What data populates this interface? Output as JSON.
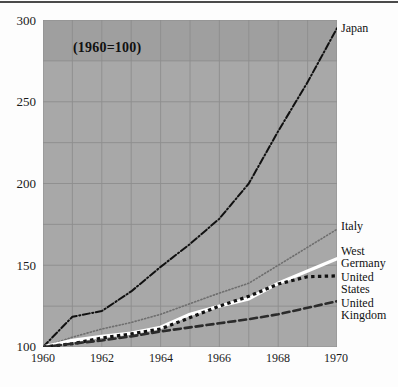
{
  "figure": {
    "annotation": "(1960=100)",
    "background_color": "#a8a8a8",
    "rule_color": "#4a4a4a"
  },
  "axis": {
    "y_ticks": [
      "100",
      "150",
      "200",
      "250",
      "300"
    ],
    "x_ticks": [
      "1960",
      "1962",
      "1964",
      "1966",
      "1968",
      "1970"
    ]
  },
  "series_labels": {
    "japan": "Japan",
    "italy": "Italy",
    "west_germany": "West\nGermany",
    "united_states": "United\nStates",
    "united_kingdom": "United\nKingdom"
  },
  "chart_data": {
    "type": "line",
    "title": "",
    "subtitle": "",
    "annotation": "(1960=100)",
    "xlabel": "",
    "ylabel": "",
    "xlim": [
      1960,
      1970
    ],
    "ylim": [
      100,
      300
    ],
    "grid": true,
    "x_tick_values": [
      1960,
      1962,
      1964,
      1966,
      1968,
      1970
    ],
    "y_tick_values": [
      100,
      150,
      200,
      250,
      300
    ],
    "y_gridline_values": [
      100,
      125,
      150,
      175,
      200,
      225,
      250,
      275,
      300
    ],
    "x_gridline_values": [
      1960,
      1961,
      1962,
      1963,
      1964,
      1965,
      1966,
      1967,
      1968,
      1969,
      1970
    ],
    "legend_position": "right-inline-labels",
    "x": [
      1960,
      1961,
      1962,
      1963,
      1964,
      1965,
      1966,
      1967,
      1968,
      1969,
      1970
    ],
    "series": [
      {
        "name": "Japan",
        "color": "#111111",
        "line_style": "dash-dot",
        "line_width": 2.0,
        "values": [
          100,
          118.5,
          122,
          134,
          149,
          163,
          178.5,
          200,
          232,
          262,
          295
        ]
      },
      {
        "name": "Italy",
        "color": "#6e6e6e",
        "line_style": "dotted",
        "line_width": 1.6,
        "values": [
          100,
          106,
          111,
          115,
          120,
          126.5,
          133,
          139,
          150,
          161,
          172
        ]
      },
      {
        "name": "West Germany",
        "color": "#ffffff",
        "line_style": "solid",
        "line_width": 3.4,
        "values": [
          100,
          104,
          106.5,
          108.5,
          112,
          120,
          125,
          129.5,
          139,
          146.5,
          154
        ]
      },
      {
        "name": "United States",
        "color": "#111111",
        "line_style": "square-dotted",
        "line_width": 3.2,
        "values": [
          100,
          102,
          105.5,
          108,
          111,
          118,
          125,
          131,
          138.5,
          143,
          143.5
        ]
      },
      {
        "name": "United Kingdom",
        "color": "#2b2b2b",
        "line_style": "dashed",
        "line_width": 2.6,
        "values": [
          100,
          102,
          104,
          106.5,
          109.5,
          112,
          114.5,
          117,
          120,
          124,
          128
        ]
      }
    ]
  }
}
